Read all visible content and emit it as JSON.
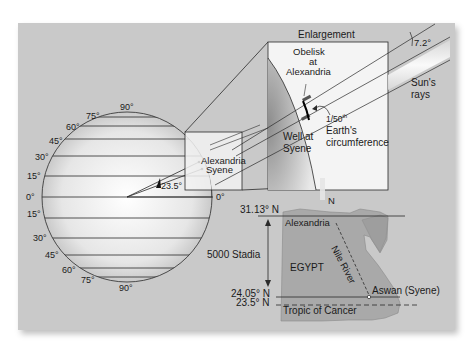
{
  "figure": {
    "globe": {
      "latitude_labels_left_top": [
        "90°",
        "75°",
        "60°",
        "45°",
        "30°",
        "15°"
      ],
      "equator_label_left": "0°",
      "equator_label_right": "0°",
      "latitude_labels_left_bottom": [
        "15°",
        "30°",
        "45°",
        "60°",
        "75°",
        "90°"
      ],
      "angle_label": "23.5°",
      "point_labels": [
        "Alexandria",
        "Syene"
      ]
    },
    "enlargement": {
      "title": "Enlargement",
      "obelisk_label_line1": "Obelisk",
      "obelisk_label_line2": "at",
      "obelisk_label_line3": "Alexandria",
      "well_label_line1": "Well at",
      "well_label_line2": "Syene",
      "arc_label_fraction": "1/50",
      "arc_label_superscript": "th",
      "arc_label_line2": "Earth's",
      "arc_label_line3": "circumference",
      "angle_label": "7.2°",
      "sun_rays_line1": "Sun's",
      "sun_rays_line2": "rays"
    },
    "map": {
      "north_label": "N",
      "lat_top": "31.13° N",
      "distance_label": "5000 Stadia",
      "lat_syene": "24.05° N",
      "lat_tropic": "23.5° N",
      "country_label": "EGYPT",
      "river_label": "Nile River",
      "city_top": "Alexandria",
      "city_bottom": "Aswan (Syene)",
      "tropic_label": "Tropic of Cancer"
    },
    "colors": {
      "panel_bg": "#c9c9c9",
      "line": "#2a2a2a",
      "map_fill": "#a9a9a9",
      "box_fill": "#f4f4f4"
    }
  }
}
